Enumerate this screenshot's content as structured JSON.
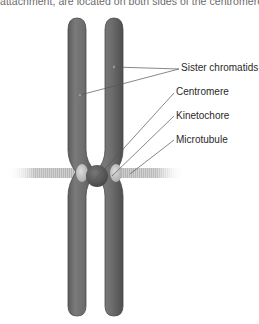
{
  "caption": "attachment, are located on both sides of the centromere.",
  "diagram": {
    "labels": [
      {
        "id": "sister-chromatids",
        "text": "Sister chromatids"
      },
      {
        "id": "centromere",
        "text": "Centromere"
      },
      {
        "id": "kinetochore",
        "text": "Kinetochore"
      },
      {
        "id": "microtubule",
        "text": "Microtubule"
      }
    ],
    "colors": {
      "chromatid": "#6e6e6e",
      "chromatid_edge": "#555555",
      "chromatid_highlight": "#8a8a8a",
      "centromere": "#5a5a5a",
      "kinetochore": "#c4c4c4",
      "microtubule": "#b8b8b8",
      "leader_line": "#555555",
      "label_text": "#2a2a2a",
      "caption_text": "#6a6a6a"
    }
  }
}
